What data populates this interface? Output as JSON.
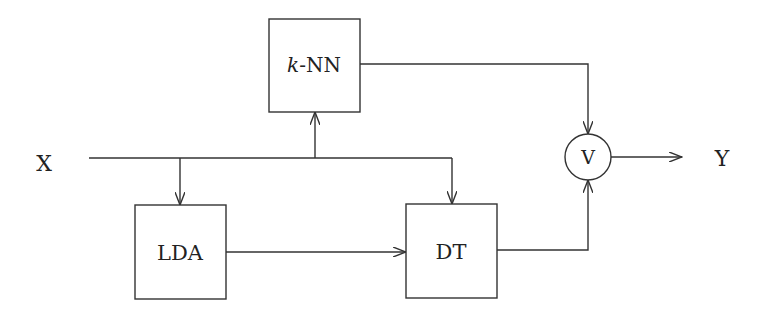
{
  "diagram": {
    "input_label": "X",
    "output_label": "Y",
    "nodes": {
      "knn": {
        "label_italic": "k",
        "label_rest": "-NN"
      },
      "lda": {
        "label": "LDA"
      },
      "dt": {
        "label": "DT"
      },
      "vote": {
        "label": "V"
      }
    },
    "edges": [
      {
        "from": "X",
        "to": "k-NN"
      },
      {
        "from": "X",
        "to": "LDA"
      },
      {
        "from": "X",
        "to": "DT"
      },
      {
        "from": "LDA",
        "to": "DT"
      },
      {
        "from": "k-NN",
        "to": "V"
      },
      {
        "from": "DT",
        "to": "V"
      },
      {
        "from": "V",
        "to": "Y"
      }
    ],
    "colors": {
      "stroke": "#333333",
      "background": "#ffffff"
    }
  }
}
